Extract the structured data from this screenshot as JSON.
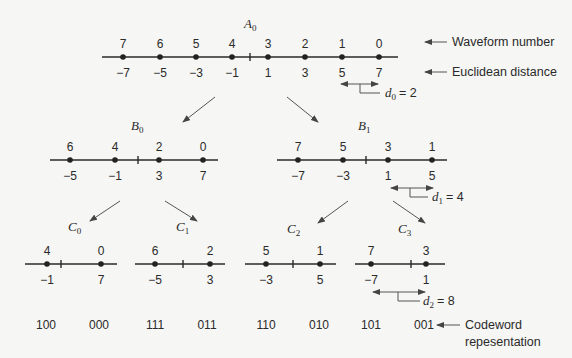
{
  "diagram": {
    "annotations": {
      "waveform_number": "Waveform number",
      "euclidean_distance": "Euclidean distance",
      "codeword_line1": "Codeword",
      "codeword_line2": "repesentation"
    },
    "distances": {
      "d0": {
        "var": "d",
        "sub": "0",
        "value": "= 2"
      },
      "d1": {
        "var": "d",
        "sub": "1",
        "value": "= 4"
      },
      "d2": {
        "var": "d",
        "sub": "2",
        "value": "= 8"
      }
    },
    "nodes": {
      "A0": {
        "var": "A",
        "sub": "0",
        "waveforms": [
          "7",
          "6",
          "5",
          "4",
          "3",
          "2",
          "1",
          "0"
        ],
        "distances": [
          "−7",
          "−5",
          "−3",
          "−1",
          "1",
          "3",
          "5",
          "7"
        ]
      },
      "B0": {
        "var": "B",
        "sub": "0",
        "waveforms": [
          "6",
          "4",
          "2",
          "0"
        ],
        "distances": [
          "−5",
          "−1",
          "3",
          "7"
        ]
      },
      "B1": {
        "var": "B",
        "sub": "1",
        "waveforms": [
          "7",
          "5",
          "3",
          "1"
        ],
        "distances": [
          "−7",
          "−3",
          "1",
          "5"
        ]
      },
      "C0": {
        "var": "C",
        "sub": "0",
        "waveforms": [
          "4",
          "0"
        ],
        "distances": [
          "−1",
          "7"
        ]
      },
      "C1": {
        "var": "C",
        "sub": "1",
        "waveforms": [
          "6",
          "2"
        ],
        "distances": [
          "−5",
          "3"
        ]
      },
      "C2": {
        "var": "C",
        "sub": "2",
        "waveforms": [
          "5",
          "1"
        ],
        "distances": [
          "−3",
          "5"
        ]
      },
      "C3": {
        "var": "C",
        "sub": "3",
        "waveforms": [
          "7",
          "3"
        ],
        "distances": [
          "−7",
          "1"
        ]
      }
    },
    "codewords": [
      "100",
      "000",
      "111",
      "011",
      "110",
      "010",
      "101",
      "001"
    ]
  }
}
